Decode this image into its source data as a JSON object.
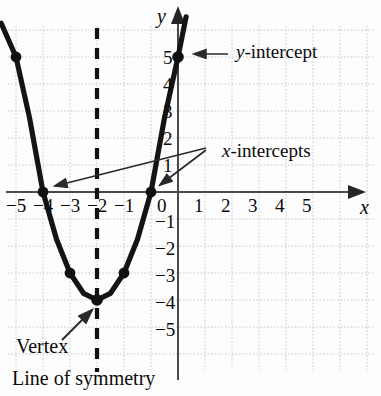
{
  "chart_data": {
    "type": "line",
    "title": "",
    "subtitle": "",
    "xlabel": "x",
    "ylabel": "y",
    "xlim": [
      -6.6,
      6.0
    ],
    "ylim": [
      -6.3,
      6.2
    ],
    "grid": true,
    "grid_step": 1,
    "legend": "none",
    "function": "y = x^2 + 6x + 5",
    "series": [
      {
        "name": "parabola",
        "x": [
          -6.55,
          -6,
          -5.5,
          -5,
          -4.5,
          -4,
          -3.5,
          -3,
          -2.5,
          -2,
          -1.5,
          -1,
          -0.5,
          0,
          0.3
        ],
        "y": [
          6.25,
          5,
          2.75,
          0,
          -1.75,
          -3,
          -3.75,
          -4,
          -3.75,
          -3,
          -1.75,
          0,
          2.75,
          5,
          6.49
        ]
      }
    ],
    "points": [
      {
        "x": -6,
        "y": 5,
        "label": ""
      },
      {
        "x": -5,
        "y": 0,
        "label": "x-intercept"
      },
      {
        "x": -4,
        "y": -3,
        "label": ""
      },
      {
        "x": -3,
        "y": -4,
        "label": "Vertex"
      },
      {
        "x": -2,
        "y": -3,
        "label": ""
      },
      {
        "x": -1,
        "y": 0,
        "label": "x-intercept"
      },
      {
        "x": 0,
        "y": 5,
        "label": "y-intercept"
      }
    ],
    "line_of_symmetry": {
      "x": -3,
      "style": "dashed"
    },
    "x_ticks": [
      "-5",
      "-4",
      "-3",
      "-2",
      "-1",
      "0",
      "1",
      "2",
      "3",
      "4",
      "5"
    ],
    "x_tick_values": [
      -5,
      -4,
      -3,
      -2,
      -1,
      0,
      1,
      2,
      3,
      4,
      5
    ],
    "y_ticks": [
      "5",
      "4",
      "3",
      "2",
      "1",
      "-1",
      "-2",
      "-3",
      "-4",
      "-5"
    ],
    "y_tick_values": [
      5,
      4,
      3,
      2,
      1,
      -1,
      -2,
      -3,
      -4,
      -5
    ]
  },
  "axes": {
    "x_axis_label": "x",
    "y_axis_label": "y"
  },
  "ticks": {
    "x": {
      "neg5": "−5",
      "neg4": "−4",
      "neg3": "−3",
      "neg2": "−2",
      "neg1": "−1",
      "zero": "0",
      "p1": "1",
      "p2": "2",
      "p3": "3",
      "p4": "4",
      "p5": "5"
    },
    "y": {
      "p5": "5",
      "p4": "4",
      "p3": "3",
      "p2": "2",
      "p1": "1",
      "n1": "−1",
      "n2": "−2",
      "n3": "−3",
      "n4": "−4",
      "n5": "−5"
    }
  },
  "annotations": {
    "y_intercept_italic": "y",
    "y_intercept_rest": "-intercept",
    "x_intercepts_italic": "x",
    "x_intercepts_rest": "-intercepts",
    "vertex": "Vertex",
    "line_of_symmetry": "Line of symmetry"
  },
  "colors": {
    "background": "#fdfdfd",
    "grid": "#c9c9cf",
    "axis": "#4a4a4a",
    "curve": "#141414",
    "point": "#111111",
    "text": "#0b0b0b",
    "annotation_line": "#3c3c3c",
    "dashed_line": "#111111"
  }
}
